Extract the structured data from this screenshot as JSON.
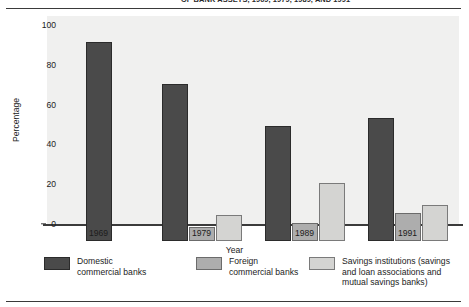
{
  "title": "OF BANK ASSETS, 1969, 1979, 1989, AND 1991",
  "chart_data": {
    "type": "bar",
    "title": "OF BANK ASSETS, 1969, 1979, 1989, AND 1991",
    "xlabel": "Year",
    "ylabel": "Percentage",
    "ylim": [
      0,
      100
    ],
    "yticks": [
      0,
      20,
      40,
      60,
      80,
      100
    ],
    "ytick_labels": [
      "0",
      "20",
      "40",
      "60",
      "80",
      "100"
    ],
    "grid": false,
    "legend_position": "bottom",
    "categories": [
      "1969",
      "1979",
      "1989",
      "1991"
    ],
    "series": [
      {
        "name": "Domestic commercial banks",
        "legend_label": "Domestic\ncommercial banks",
        "color": "#4a4a4a",
        "values": [
          100,
          79,
          58,
          62
        ]
      },
      {
        "name": "Foreign commercial banks",
        "legend_label": "Foreign\ncommercial banks",
        "color": "#adadad",
        "values": [
          0,
          7,
          9,
          14
        ]
      },
      {
        "name": "Savings institutions (savings and loan associations and mutual savings banks)",
        "legend_label": "Savings institutions (savings\nand loan associations and\nmutual savings banks)",
        "color": "#d4d4d2",
        "values": [
          0,
          13,
          29,
          18
        ]
      }
    ]
  }
}
